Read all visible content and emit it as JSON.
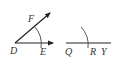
{
  "diagram": {
    "figure_left": {
      "vertex_label": "D",
      "ray1_label": "E",
      "ray2_label": "F"
    },
    "figure_right": {
      "start_label": "Q",
      "arc_point_label": "R",
      "end_label": "Y"
    },
    "colors": {
      "line": "#222222",
      "label": "#333333",
      "background": "#ffffff"
    }
  }
}
